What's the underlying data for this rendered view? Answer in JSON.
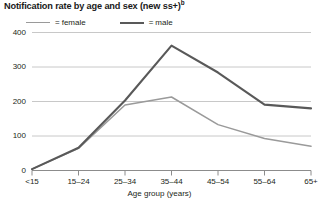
{
  "chart_data": {
    "type": "line",
    "title": "Notification rate by age and sex (new ss+)",
    "title_superscript": "b",
    "xlabel": "Age group (years)",
    "ylabel": "",
    "categories": [
      "<15",
      "15–24",
      "25–34",
      "35–44",
      "45–54",
      "55–64",
      "65+"
    ],
    "ylim": [
      0,
      400
    ],
    "yticks": [
      0,
      100,
      200,
      300,
      400
    ],
    "ytick_labels": [
      "0",
      "100",
      "200",
      "300",
      "400"
    ],
    "grid": true,
    "legend_position": "top-left",
    "series": [
      {
        "name": "female",
        "color": "#9a9a9a",
        "values": [
          4,
          64,
          190,
          213,
          133,
          93,
          70
        ]
      },
      {
        "name": "male",
        "color": "#595959",
        "values": [
          4,
          66,
          203,
          362,
          284,
          191,
          180
        ]
      }
    ],
    "legend": [
      {
        "marker": "=",
        "label": "female"
      },
      {
        "marker": "=",
        "label": "male"
      }
    ]
  },
  "colors": {
    "female_line": "#9a9a9a",
    "male_line": "#595959",
    "gridline": "#c8c8c8",
    "axis": "#8c8c8c",
    "text": "#231f20"
  }
}
